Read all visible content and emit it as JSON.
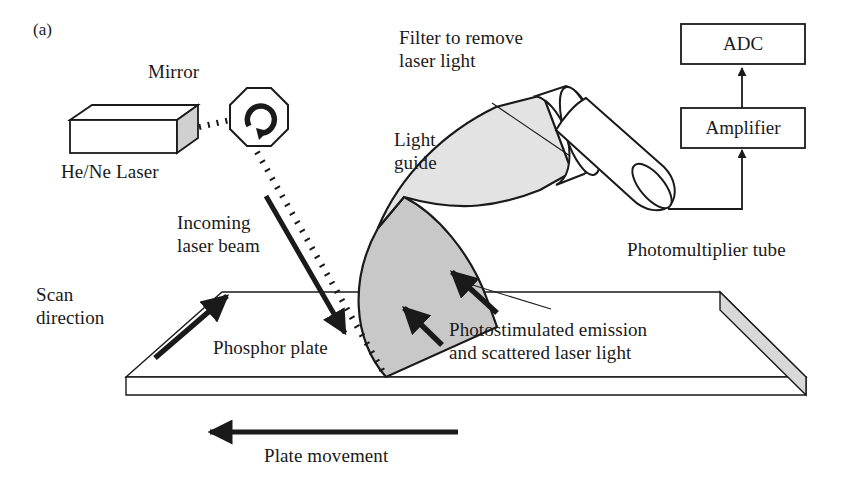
{
  "figure": {
    "panel_letter": "(a)",
    "background_color": "#ffffff",
    "ink_color": "#1a1a1a"
  },
  "colors": {
    "emission_fan_gray": "#c8c8c8",
    "light_guide_gray": "#e3e3e3",
    "plate_edge_gray": "#d8d8d8",
    "laser_end_gray": "#d0d0d0",
    "stroke": "#1a1a1a"
  },
  "labels": {
    "mirror": "Mirror",
    "laser": "He/Ne Laser",
    "incoming_beam_line1": "Incoming",
    "incoming_beam_line2": "laser beam",
    "scan_direction_line1": "Scan",
    "scan_direction_line2": "direction",
    "phosphor_plate": "Phosphor plate",
    "filter_line1": "Filter to remove",
    "filter_line2": "laser light",
    "light_guide_line1": "Light",
    "light_guide_line2": "guide",
    "photomultiplier_tube": "Photomultiplier tube",
    "emission_line1": "Photostimulated emission",
    "emission_line2": "and scattered laser light",
    "plate_movement": "Plate movement"
  },
  "boxes": {
    "adc": "ADC",
    "amplifier": "Amplifier"
  },
  "icons": {
    "mirror_rotation": "rotation-arrow-icon"
  }
}
